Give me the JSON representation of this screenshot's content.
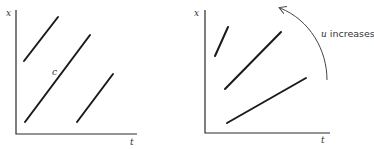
{
  "panels": [
    {
      "id": "left",
      "axes": {
        "y_label": "x",
        "x_label": "t"
      },
      "curve_label": "c",
      "lines": [
        {
          "x1": 24,
          "y1": 61,
          "x2": 58,
          "y2": 17
        },
        {
          "x1": 25,
          "y1": 122,
          "x2": 90,
          "y2": 35
        },
        {
          "x1": 77,
          "y1": 122,
          "x2": 113,
          "y2": 74
        }
      ]
    },
    {
      "id": "right",
      "axes": {
        "y_label": "x",
        "x_label": "t"
      },
      "annotation": "u increases",
      "annotation_var": "u",
      "annotation_rest": " increases",
      "lines": [
        {
          "x1": 215,
          "y1": 56,
          "x2": 228,
          "y2": 27
        },
        {
          "x1": 225,
          "y1": 89,
          "x2": 281,
          "y2": 32
        },
        {
          "x1": 227,
          "y1": 123,
          "x2": 306,
          "y2": 78
        }
      ]
    }
  ]
}
